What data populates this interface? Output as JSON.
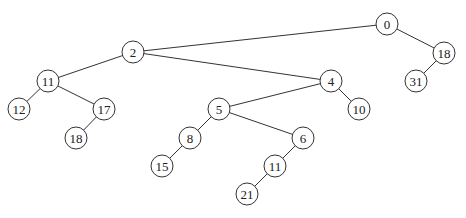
{
  "diagram": {
    "type": "tree",
    "nodes": [
      {
        "id": "n0",
        "label": "0",
        "x": 387,
        "y": 24
      },
      {
        "id": "n18",
        "label": "18",
        "x": 444,
        "y": 53
      },
      {
        "id": "n31",
        "label": "31",
        "x": 416,
        "y": 81
      },
      {
        "id": "n2",
        "label": "2",
        "x": 133,
        "y": 52
      },
      {
        "id": "n11a",
        "label": "11",
        "x": 48,
        "y": 81
      },
      {
        "id": "n12",
        "label": "12",
        "x": 19,
        "y": 109
      },
      {
        "id": "n17",
        "label": "17",
        "x": 104,
        "y": 109
      },
      {
        "id": "n18b",
        "label": "18",
        "x": 76,
        "y": 138
      },
      {
        "id": "n4",
        "label": "4",
        "x": 331,
        "y": 81
      },
      {
        "id": "n10",
        "label": "10",
        "x": 359,
        "y": 109
      },
      {
        "id": "n5",
        "label": "5",
        "x": 219,
        "y": 109
      },
      {
        "id": "n8",
        "label": "8",
        "x": 190,
        "y": 138
      },
      {
        "id": "n15",
        "label": "15",
        "x": 162,
        "y": 166
      },
      {
        "id": "n6",
        "label": "6",
        "x": 303,
        "y": 138
      },
      {
        "id": "n11b",
        "label": "11",
        "x": 275,
        "y": 166
      },
      {
        "id": "n21",
        "label": "21",
        "x": 247,
        "y": 194
      }
    ],
    "edges": [
      [
        "n0",
        "n2"
      ],
      [
        "n0",
        "n18"
      ],
      [
        "n18",
        "n31"
      ],
      [
        "n2",
        "n11a"
      ],
      [
        "n2",
        "n4"
      ],
      [
        "n11a",
        "n12"
      ],
      [
        "n11a",
        "n17"
      ],
      [
        "n17",
        "n18b"
      ],
      [
        "n4",
        "n5"
      ],
      [
        "n4",
        "n10"
      ],
      [
        "n5",
        "n8"
      ],
      [
        "n5",
        "n6"
      ],
      [
        "n8",
        "n15"
      ],
      [
        "n6",
        "n11b"
      ],
      [
        "n11b",
        "n21"
      ]
    ]
  }
}
